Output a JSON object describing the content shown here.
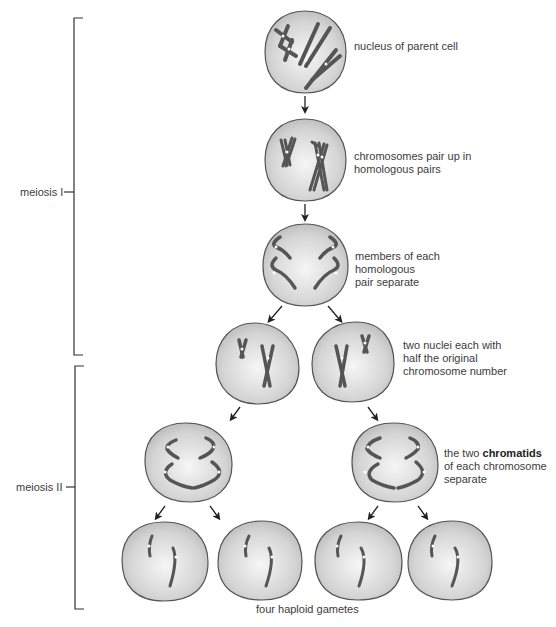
{
  "diagram": {
    "title": "Meiosis",
    "phases": [
      {
        "id": "meiosis-1",
        "label": "meiosis I"
      },
      {
        "id": "meiosis-2",
        "label": "meiosis II"
      }
    ],
    "steps": [
      {
        "id": "parent",
        "text": "nucleus of parent cell"
      },
      {
        "id": "pair-up",
        "line1": "chromosomes pair up in",
        "line2": "homologous pairs"
      },
      {
        "id": "separate",
        "line1": "members of each",
        "line2": "homologous",
        "line3": "pair separate"
      },
      {
        "id": "two-nuclei",
        "line1": "two nuclei each with",
        "line2": "half the original",
        "line3": "chromosome number"
      },
      {
        "id": "chromatids",
        "pre": "the two ",
        "bold": "chromatids",
        "line2": "of each chromosome",
        "line3": "separate"
      }
    ],
    "result_label": "four haploid gametes"
  },
  "colors": {
    "cell_fill_center": "#f4f4f4",
    "cell_fill_edge": "#bdbdbd",
    "cell_stroke": "#555555",
    "chromosome": "#5a5a5a",
    "arrow": "#222222",
    "bracket": "#333333"
  }
}
